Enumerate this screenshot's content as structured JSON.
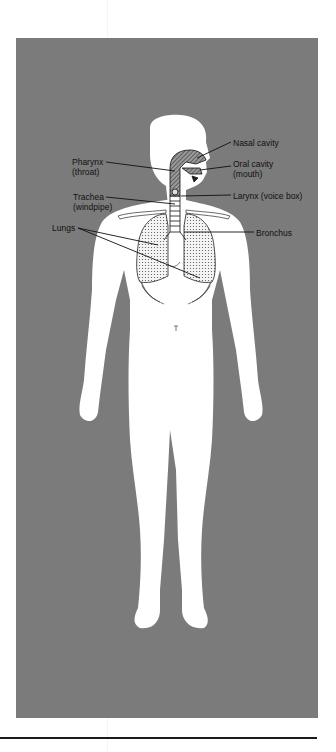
{
  "figure": {
    "background_color": "#7b7b7b",
    "body_color": "#ffffff",
    "labels": {
      "nasal_cavity": "Nasal cavity",
      "oral_cavity_1": "Oral cavity",
      "oral_cavity_2": "(mouth)",
      "pharynx_1": "Pharynx",
      "pharynx_2": "(throat)",
      "larynx": "Larynx (voice box)",
      "trachea_1": "Trachea",
      "trachea_2": "(windpipe)",
      "lungs": "Lungs",
      "bronchus": "Bronchus"
    }
  }
}
